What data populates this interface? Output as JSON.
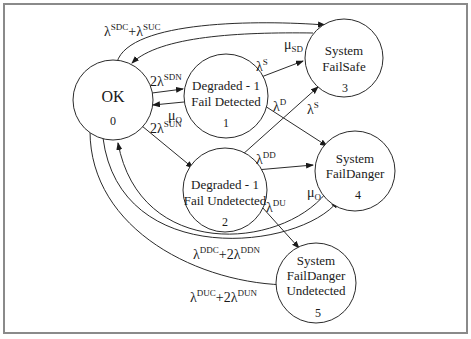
{
  "diagram": {
    "type": "state-transition",
    "states": [
      {
        "id": 0,
        "lines": [
          "OK"
        ],
        "number": "0"
      },
      {
        "id": 1,
        "lines": [
          "Degraded - 1",
          "Fail Detected"
        ],
        "number": "1"
      },
      {
        "id": 2,
        "lines": [
          "Degraded - 1",
          "Fail Undetected"
        ],
        "number": "2"
      },
      {
        "id": 3,
        "lines": [
          "System",
          "FailSafe"
        ],
        "number": "3"
      },
      {
        "id": 4,
        "lines": [
          "System",
          "FailDanger"
        ],
        "number": "4"
      },
      {
        "id": 5,
        "lines": [
          "System",
          "FailDanger",
          "Undetected"
        ],
        "number": "5"
      }
    ],
    "transitions": [
      {
        "from": 0,
        "to": 3,
        "label": "λSDC+λSUC",
        "parts": {
          "a": "λ",
          "a_sup": "SDC",
          "plus": "+λ",
          "b_sup": "SUC"
        }
      },
      {
        "from": 3,
        "to": 0,
        "label": "μSD",
        "parts": {
          "sym": "μ",
          "sub": "SD"
        }
      },
      {
        "from": 0,
        "to": 1,
        "label": "2λSDN",
        "parts": {
          "sym": "2λ",
          "sup": "SDN"
        }
      },
      {
        "from": 1,
        "to": 0,
        "label": "μO",
        "parts": {
          "sym": "μ",
          "sub": "O"
        }
      },
      {
        "from": 0,
        "to": 2,
        "label": "2λSUN",
        "parts": {
          "sym": "2λ",
          "sup": "SUN"
        }
      },
      {
        "from": 1,
        "to": 3,
        "label": "λS",
        "parts": {
          "sym": "λ",
          "sup": "S"
        }
      },
      {
        "from": 1,
        "to": 4,
        "label": "λD",
        "parts": {
          "sym": "λ",
          "sup": "D"
        }
      },
      {
        "from": 2,
        "to": 3,
        "label": "λS",
        "parts": {
          "sym": "λ",
          "sup": "S"
        }
      },
      {
        "from": 2,
        "to": 4,
        "label": "λDD",
        "parts": {
          "sym": "λ",
          "sup": "DD"
        }
      },
      {
        "from": 2,
        "to": 5,
        "label": "λDU",
        "parts": {
          "sym": "λ",
          "sup": "DU"
        }
      },
      {
        "from": 4,
        "to": 0,
        "label": "μO",
        "parts": {
          "sym": "μ",
          "sub": "O"
        }
      },
      {
        "from": 0,
        "to": 4,
        "label": "λDDC+2λDDN",
        "parts": {
          "a": "λ",
          "a_sup": "DDC",
          "plus": "+2λ",
          "b_sup": "DDN"
        }
      },
      {
        "from": 0,
        "to": 5,
        "label": "λDUC+2λDUN",
        "parts": {
          "a": "λ",
          "a_sup": "DUC",
          "plus": "+2λ",
          "b_sup": "DUN"
        }
      }
    ]
  }
}
